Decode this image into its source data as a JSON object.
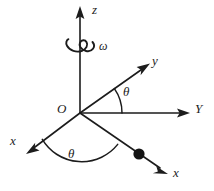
{
  "figure": {
    "type": "vector-diagram",
    "width": 214,
    "height": 191,
    "background_color": "#ffffff",
    "stroke_color": "#1c1c1c"
  },
  "labels": {
    "z_axis": "z",
    "omega": "ω",
    "y_rotating": "y",
    "Y_fixed": "Y",
    "origin": "O",
    "theta_upper": "θ",
    "theta_lower": "θ",
    "x_left": "x",
    "x_right": "x"
  },
  "geometry": {
    "origin": {
      "x": 80,
      "y": 113
    },
    "axes": [
      {
        "name": "z-axis",
        "label": "z",
        "from": {
          "x": 80,
          "y": 113
        },
        "to": {
          "x": 80,
          "y": 10
        },
        "arrow": true,
        "direction": "up"
      },
      {
        "name": "Y-axis-fixed",
        "label": "Y",
        "from": {
          "x": 80,
          "y": 113
        },
        "to": {
          "x": 189,
          "y": 113
        },
        "arrow": true,
        "direction": "right"
      },
      {
        "name": "y-axis-rotating",
        "label": "y",
        "from": {
          "x": 80,
          "y": 113
        },
        "to": {
          "x": 149,
          "y": 64
        },
        "arrow": true,
        "direction": "up-right"
      },
      {
        "name": "x-axis-left",
        "label": "x",
        "from": {
          "x": 80,
          "y": 113
        },
        "to": {
          "x": 27,
          "y": 153
        },
        "arrow": true,
        "direction": "down-left"
      },
      {
        "name": "x-axis-right",
        "label": "x",
        "from": {
          "x": 80,
          "y": 113
        },
        "to": {
          "x": 167,
          "y": 173
        },
        "arrow": true,
        "direction": "down-right"
      }
    ],
    "angle_arcs": [
      {
        "name": "theta-between-y-and-Y",
        "label": "θ",
        "radius": 42,
        "from_deg": 0,
        "to_deg": 35
      },
      {
        "name": "theta-between-x-axes",
        "label": "θ",
        "radius": 46,
        "from_deg": 215,
        "to_deg": 325
      }
    ],
    "spin_indicator": {
      "name": "omega-rotation-loop",
      "label": "ω",
      "center": {
        "x": 80,
        "y": 46
      },
      "width": 28,
      "height": 13
    },
    "particle": {
      "name": "point-mass",
      "center": {
        "x": 139,
        "y": 154
      },
      "radius": 5.5,
      "on_axis": "x-axis-right"
    }
  }
}
